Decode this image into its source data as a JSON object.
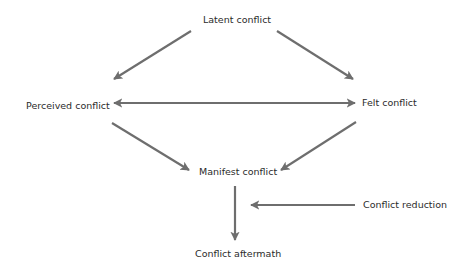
{
  "diagram": {
    "colors": {
      "arrow": "#6e6e6e",
      "text": "#2b2b2b",
      "background": "#ffffff"
    },
    "nodes": [
      {
        "id": "latent",
        "label": "Latent conflict"
      },
      {
        "id": "perceived",
        "label": "Perceived conflict"
      },
      {
        "id": "felt",
        "label": "Felt conflict"
      },
      {
        "id": "manifest",
        "label": "Manifest conflict"
      },
      {
        "id": "reduction",
        "label": "Conflict reduction"
      },
      {
        "id": "aftermath",
        "label": "Conflict aftermath"
      }
    ],
    "edges": [
      {
        "from": "latent",
        "to": "perceived"
      },
      {
        "from": "latent",
        "to": "felt"
      },
      {
        "from": "perceived",
        "to": "felt",
        "bidirectional": true
      },
      {
        "from": "perceived",
        "to": "manifest"
      },
      {
        "from": "felt",
        "to": "manifest"
      },
      {
        "from": "manifest",
        "to": "aftermath"
      },
      {
        "from": "reduction",
        "to": "manifest-aftermath-edge"
      }
    ]
  }
}
